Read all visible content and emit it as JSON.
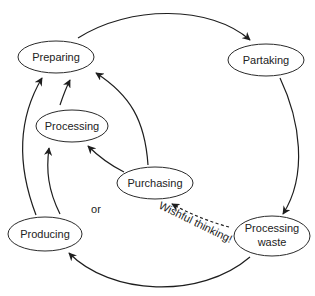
{
  "diagram": {
    "type": "cycle-flow",
    "nodes": [
      {
        "id": "preparing",
        "label": "Preparing"
      },
      {
        "id": "partaking",
        "label": "Partaking"
      },
      {
        "id": "processing",
        "label": "Processing"
      },
      {
        "id": "purchasing",
        "label": "Purchasing"
      },
      {
        "id": "producing",
        "label": "Producing"
      },
      {
        "id": "processing_waste",
        "label_line1": "Processing",
        "label_line2": "waste"
      }
    ],
    "edges": [
      {
        "from": "preparing",
        "to": "partaking",
        "style": "solid"
      },
      {
        "from": "partaking",
        "to": "processing_waste",
        "style": "solid"
      },
      {
        "from": "processing_waste",
        "to": "producing",
        "style": "solid"
      },
      {
        "from": "processing_waste",
        "to": "purchasing",
        "style": "dashed",
        "label": "Wishful thinking!"
      },
      {
        "from": "producing",
        "to": "preparing",
        "style": "solid"
      },
      {
        "from": "producing",
        "to": "processing",
        "style": "solid"
      },
      {
        "from": "processing",
        "to": "preparing",
        "style": "solid"
      },
      {
        "from": "purchasing",
        "to": "processing",
        "style": "solid"
      },
      {
        "from": "purchasing",
        "to": "preparing",
        "style": "solid"
      }
    ],
    "annotations": {
      "or_label": "or",
      "wishful_label": "Wishful thinking!"
    },
    "colors": {
      "stroke": "#1e1e1e",
      "text": "#222222",
      "background": "#ffffff"
    }
  }
}
